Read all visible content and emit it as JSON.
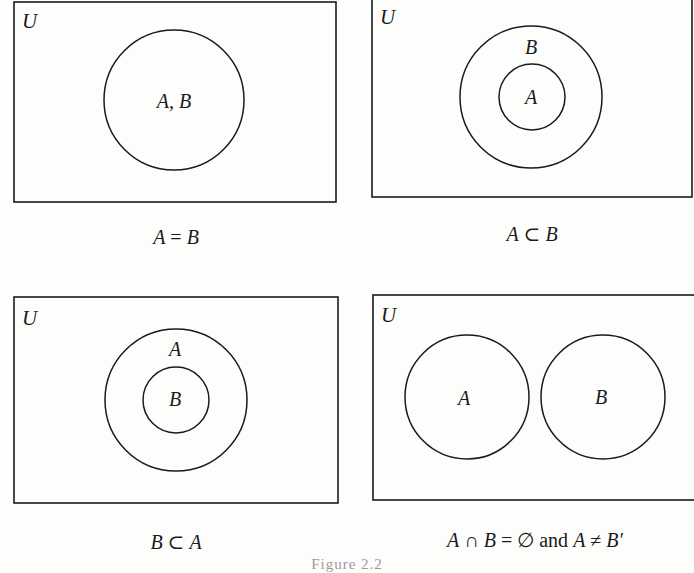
{
  "panels": [
    {
      "id": "equal",
      "universe_label": "U",
      "region_labels": [
        "A, B"
      ],
      "caption": "A = B",
      "relation": "equal"
    },
    {
      "id": "a-subset-b",
      "universe_label": "U",
      "region_labels": [
        "B",
        "A"
      ],
      "caption": "A ⊂ B",
      "relation": "subset"
    },
    {
      "id": "b-subset-a",
      "universe_label": "U",
      "region_labels": [
        "A",
        "B"
      ],
      "caption": "B ⊂ A",
      "relation": "subset"
    },
    {
      "id": "disjoint",
      "universe_label": "U",
      "region_labels": [
        "A",
        "B"
      ],
      "caption": "A ∩ B = ∅ and A ≠ B′",
      "relation": "disjoint"
    }
  ],
  "captions": {
    "p1": {
      "a": "A",
      "op": " = ",
      "b": "B"
    },
    "p2": {
      "a": "A",
      "op": " ⊂ ",
      "b": "B"
    },
    "p3": {
      "a": "B",
      "op": " ⊂ ",
      "b": "A"
    },
    "p4": {
      "a": "A",
      "op1": " ∩ ",
      "b": "B",
      "op2": " = ",
      "empty": "∅",
      "and": " and ",
      "c": "A",
      "op3": " ≠ ",
      "d": "B′"
    }
  },
  "figure_caption": "Figure 2.2",
  "colors": {
    "stroke": "#1a1a1a",
    "background": "#fdfdfc"
  }
}
